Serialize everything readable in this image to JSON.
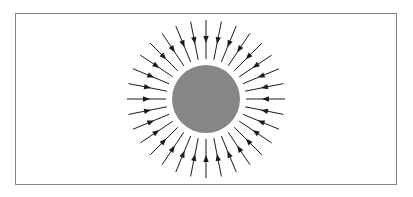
{
  "figure": {
    "type": "physics-field-diagram",
    "canvas": {
      "width": 413,
      "height": 197
    },
    "colors": {
      "background": "#ffffff",
      "frame_border": "#828282",
      "frame_fill": "#ffffff",
      "sphere_fill": "#868686",
      "line_color": "#1b1b1b"
    },
    "frame": {
      "x": 15.5,
      "y": 13.5,
      "width": 381,
      "height": 171,
      "stroke_width": 1
    },
    "sphere": {
      "cx": 206,
      "cy": 99,
      "radius": 34
    },
    "field_lines": {
      "count": 32,
      "start_angle_deg": 0,
      "angle_step_deg": 11.25,
      "inner_radius": 40,
      "outer_radius": 79,
      "line_width": 1,
      "arrow_direction": "inward",
      "arrow_tip_radius": 56,
      "arrow_length": 7,
      "arrow_half_width": 2.7
    }
  }
}
